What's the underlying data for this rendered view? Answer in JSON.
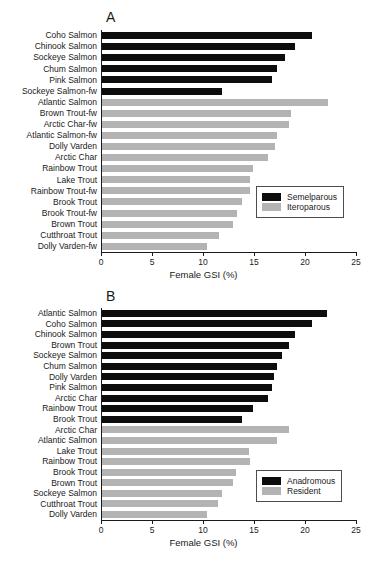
{
  "figure": {
    "panels": [
      {
        "letter": "A",
        "legend_title_semel": "Semelparous",
        "legend_title_itero": "Iteroparous"
      },
      {
        "letter": "B",
        "legend_title_semel": "Anadromous",
        "legend_title_itero": "Resident"
      }
    ],
    "axis": {
      "xlabel": "Female GSI (%)",
      "ticks": [
        "0",
        "5",
        "10",
        "15",
        "20",
        "25"
      ]
    },
    "colors": {
      "group1": "#0d0d0d",
      "group2": "#b3b3b3",
      "axis": "#1a1a1a"
    }
  },
  "chart_data": [
    {
      "type": "bar",
      "orientation": "horizontal",
      "title": "A",
      "xlabel": "Female GSI (%)",
      "ylabel": "",
      "xlim": [
        0,
        25
      ],
      "xticks": [
        0,
        5,
        10,
        15,
        20,
        25
      ],
      "grid": false,
      "legend_position": "lower-right",
      "series": [
        {
          "name": "Semelparous",
          "color": "#0d0d0d",
          "categories": [
            "Coho Salmon",
            "Chinook Salmon",
            "Sockeye Salmon",
            "Chum Salmon",
            "Pink Salmon",
            "Sockeye Salmon-fw"
          ],
          "values": [
            20.7,
            19.0,
            18.0,
            17.3,
            16.8,
            11.9
          ]
        },
        {
          "name": "Iteroparous",
          "color": "#b3b3b3",
          "categories": [
            "Atlantic Salmon",
            "Brown Trout-fw",
            "Arctic Char-fw",
            "Atlantic Salmon-fw",
            "Dolly Varden",
            "Arctic Char",
            "Rainbow Trout",
            "Lake Trout",
            "Rainbow Trout-fw",
            "Brook Trout",
            "Brook Trout-fw",
            "Brown Trout",
            "Cutthroat Trout",
            "Dolly Varden-fw"
          ],
          "values": [
            22.3,
            18.6,
            18.4,
            17.3,
            17.1,
            16.4,
            14.9,
            14.6,
            14.6,
            13.8,
            13.3,
            12.9,
            11.6,
            10.4
          ]
        }
      ]
    },
    {
      "type": "bar",
      "orientation": "horizontal",
      "title": "B",
      "xlabel": "Female GSI (%)",
      "ylabel": "",
      "xlim": [
        0,
        25
      ],
      "xticks": [
        0,
        5,
        10,
        15,
        20,
        25
      ],
      "grid": false,
      "legend_position": "lower-right",
      "series": [
        {
          "name": "Anadromous",
          "color": "#0d0d0d",
          "categories": [
            "Atlantic Salmon",
            "Coho Salmon",
            "Chinook Salmon",
            "Brown Trout",
            "Sockeye Salmon",
            "Chum Salmon",
            "Dolly Varden",
            "Pink Salmon",
            "Arctic Char",
            "Rainbow Trout",
            "Brook Trout"
          ],
          "values": [
            22.2,
            20.7,
            19.0,
            18.4,
            17.7,
            17.3,
            17.0,
            16.8,
            16.4,
            14.9,
            13.8
          ]
        },
        {
          "name": "Resident",
          "color": "#b3b3b3",
          "categories": [
            "Arctic Char",
            "Atlantic Salmon",
            "Lake Trout",
            "Rainbow Trout",
            "Brook Trout",
            "Brown Trout",
            "Sockeye Salmon",
            "Cutthroat Trout",
            "Dolly Varden"
          ],
          "values": [
            18.4,
            17.3,
            14.5,
            14.6,
            13.2,
            12.9,
            11.9,
            11.5,
            10.4
          ]
        }
      ]
    }
  ]
}
